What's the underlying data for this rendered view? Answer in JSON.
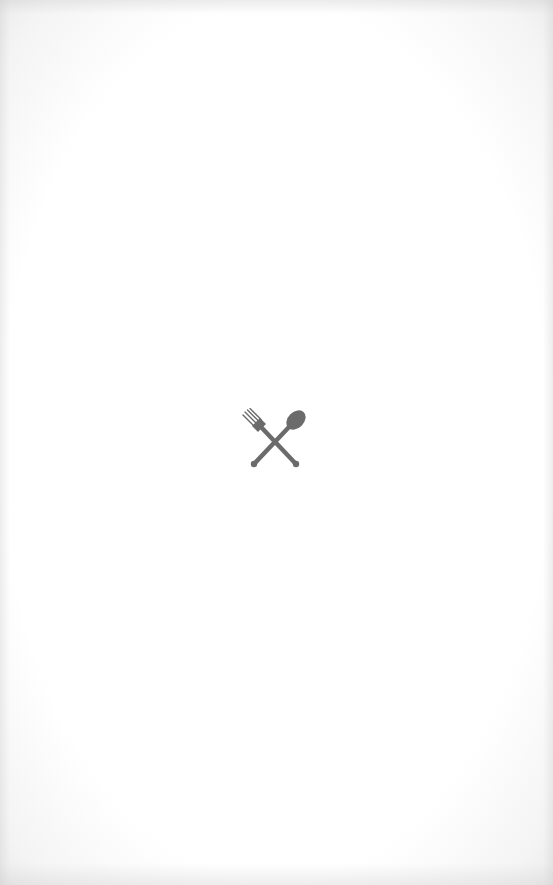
{
  "screen": {
    "type": "splash",
    "background_color": "#ffffff"
  },
  "logo": {
    "icon": "fork-and-spoon-icon",
    "color": "#6b6b6b"
  }
}
